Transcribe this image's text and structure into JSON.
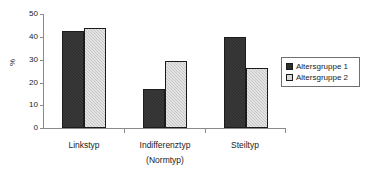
{
  "chart_data": {
    "type": "bar",
    "title": "",
    "xlabel": "(Normtyp)",
    "ylabel": "%",
    "categories": [
      "Linkstyp",
      "Indifferenztyp",
      "Steiltyp"
    ],
    "series": [
      {
        "name": "Altersgruppe 1",
        "values": [
          42.5,
          17.0,
          40.0
        ],
        "color": "#2f2f2f"
      },
      {
        "name": "Altersgruppe 2",
        "values": [
          44.0,
          29.5,
          26.5
        ],
        "color": "#c6c6c6"
      }
    ],
    "ylim": [
      0,
      50
    ],
    "yticks": [
      "0",
      "10",
      "20",
      "30",
      "40",
      "50"
    ],
    "grid": false,
    "legend_position": "right"
  },
  "axes": {
    "y_title": "%",
    "y_ticks": [
      {
        "label": "50"
      },
      {
        "label": "40"
      },
      {
        "label": "30"
      },
      {
        "label": "20"
      },
      {
        "label": "10"
      },
      {
        "label": "0"
      }
    ],
    "x_categories": [
      {
        "label": "Linkstyp"
      },
      {
        "label": "Indifferenztyp",
        "sub": "(Normtyp)"
      },
      {
        "label": "Steiltyp"
      }
    ]
  },
  "legend": {
    "entries": [
      {
        "label": "Altersgruppe 1"
      },
      {
        "label": "Altersgruppe 2"
      }
    ]
  }
}
